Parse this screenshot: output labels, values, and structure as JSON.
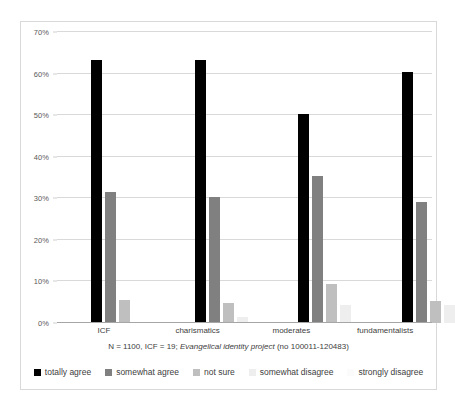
{
  "chart_data": {
    "type": "bar",
    "title": "",
    "subtitle": "",
    "xlabel": "",
    "ylabel": "",
    "ylim": [
      0,
      70
    ],
    "ytick_labels": [
      "0%",
      "10%",
      "20%",
      "30%",
      "40%",
      "50%",
      "60%",
      "70%"
    ],
    "ytick_values": [
      0,
      10,
      20,
      30,
      40,
      50,
      60,
      70
    ],
    "grid": true,
    "legend_position": "bottom",
    "categories": [
      "ICF",
      "charismatics",
      "moderates",
      "fundamentalists"
    ],
    "series": [
      {
        "name": "totally agree",
        "color": "#000000",
        "values": [
          63.3,
          63.3,
          50.2,
          60.3
        ]
      },
      {
        "name": "somewhat agree",
        "color": "#808080",
        "values": [
          31.6,
          30.3,
          35.3,
          29.1
        ]
      },
      {
        "name": "not sure",
        "color": "#bfbfbf",
        "values": [
          5.6,
          4.8,
          9.3,
          5.2
        ]
      },
      {
        "name": "somewhat disagree",
        "color": "#eeeeee",
        "values": [
          0,
          1.5,
          4.4,
          4.4
        ]
      },
      {
        "name": "strongly disagree",
        "color": "#fbfbfb",
        "values": [
          0,
          0,
          0,
          0
        ]
      }
    ],
    "annotations": [
      "N = 1100, ICF = 19; Evangelical identity project (no 100011-120483)"
    ]
  },
  "footnote": {
    "prefix": "N = 1100, ICF = 19; ",
    "italic": "Evangelical identity project",
    "suffix": " (no 100011-120483)"
  },
  "legend": {
    "items": [
      {
        "label": "totally agree"
      },
      {
        "label": "somewhat agree"
      },
      {
        "label": "not sure"
      },
      {
        "label": "somewhat disagree"
      },
      {
        "label": "strongly disagree"
      }
    ]
  }
}
